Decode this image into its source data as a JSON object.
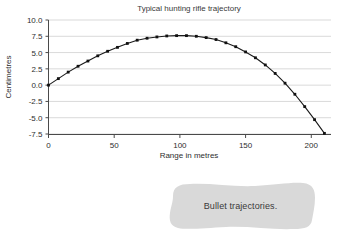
{
  "chart_data": {
    "type": "line",
    "title": "Typical hunting rifle trajectory",
    "xlabel": "Range in metres",
    "ylabel": "Centimetres",
    "xlim": [
      0,
      215
    ],
    "ylim": [
      -7.5,
      10.0
    ],
    "grid": true,
    "legend": "none",
    "xticks": [
      "0",
      "50",
      "100",
      "150",
      "200"
    ],
    "xtick_values": [
      0,
      50,
      100,
      150,
      200
    ],
    "yticks": [
      "10.0",
      "7.5",
      "5.0",
      "2.5",
      "0.0",
      "-2.5",
      "-5.0",
      "-7.5"
    ],
    "ytick_values": [
      10.0,
      7.5,
      5.0,
      2.5,
      0.0,
      -2.5,
      -5.0,
      -7.5
    ],
    "series": [
      {
        "name": "Bullet trajectory",
        "marker": "square",
        "x": [
          0,
          7.5,
          15,
          22.5,
          30,
          37.5,
          45,
          52.5,
          60,
          67.5,
          75,
          82.5,
          90,
          97.5,
          105,
          112.5,
          120,
          127.5,
          135,
          142.5,
          150,
          157.5,
          165,
          172.5,
          180,
          187.5,
          195,
          202.5,
          210
        ],
        "values": [
          0.0,
          1.0,
          2.0,
          2.9,
          3.7,
          4.5,
          5.2,
          5.8,
          6.4,
          6.9,
          7.2,
          7.4,
          7.55,
          7.6,
          7.6,
          7.5,
          7.3,
          7.0,
          6.5,
          5.9,
          5.1,
          4.2,
          3.1,
          1.8,
          0.3,
          -1.4,
          -3.3,
          -5.3,
          -7.4
        ]
      }
    ]
  },
  "callout": {
    "text": "Bullet trajectories."
  },
  "colors": {
    "background": "#ffffff",
    "gridline": "#c9c9c9",
    "axis": "#4a4a4a",
    "series": "#111111",
    "callout_fill": "#d9d9d9",
    "text": "#2e2e2e"
  }
}
